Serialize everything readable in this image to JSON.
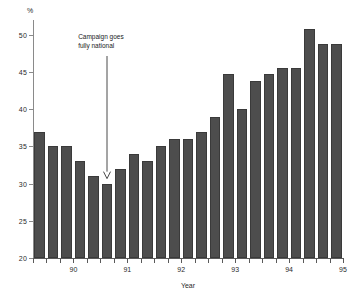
{
  "chart_data": {
    "type": "bar",
    "title": "",
    "xlabel": "Year",
    "ylabel": "%",
    "ylim": [
      20,
      52
    ],
    "grid": false,
    "legend": "none",
    "y_ticks": [
      20,
      25,
      30,
      35,
      40,
      45,
      50
    ],
    "y_tick_labels": [
      "20",
      "25",
      "30",
      "35",
      "40",
      "45",
      "50"
    ],
    "x_tick_labels": [
      "90",
      "91",
      "92",
      "93",
      "94",
      "95"
    ],
    "x_minor_ticks_per_year": 4,
    "categories": [
      "89Q4",
      "90Q1",
      "90Q2",
      "90Q3",
      "90Q4",
      "91Q1",
      "91Q2",
      "91Q3",
      "91Q4",
      "92Q1",
      "92Q2",
      "92Q3",
      "92Q4",
      "93Q1",
      "93Q2",
      "93Q3",
      "93Q4",
      "94Q1",
      "94Q2",
      "94Q3",
      "94Q4",
      "95Q1",
      "95Q2"
    ],
    "values": [
      37.0,
      35.0,
      35.0,
      33.0,
      31.0,
      30.0,
      32.0,
      34.0,
      33.0,
      35.0,
      36.0,
      36.0,
      37.0,
      39.0,
      44.8,
      40.0,
      43.8,
      44.8,
      45.6,
      45.6,
      50.8,
      48.8,
      48.8
    ],
    "bar_color": "#4d4d4d",
    "annotations": [
      {
        "text": "Campaign goes\nfully national",
        "target_category": "91Q1",
        "arrow": "down"
      }
    ]
  },
  "annotation": {
    "line1": "Campaign goes",
    "line2": "fully national"
  },
  "axis": {
    "y_unit": "%",
    "x_title": "Year"
  }
}
